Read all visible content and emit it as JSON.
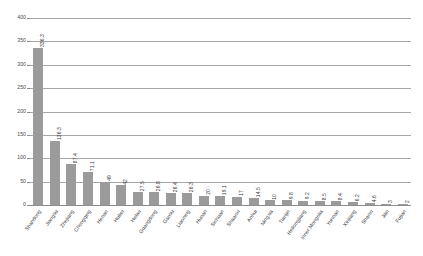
{
  "chart_data": {
    "type": "bar",
    "title": "",
    "xlabel": "",
    "ylabel": "",
    "ylim": [
      0,
      400
    ],
    "yticks": [
      0,
      50,
      100,
      150,
      200,
      250,
      300,
      350,
      400
    ],
    "grid": true,
    "legend": false,
    "bar_color": "#9b9b9b",
    "gridline_color": "#a8a8a8",
    "categories": [
      "Shandong",
      "Jiangsu",
      "Zhejiang",
      "Chongqing",
      "Henan",
      "Hubei",
      "Hebei",
      "Guangdong",
      "Gansu",
      "Liaoning",
      "Hunan",
      "Sichuan",
      "Shaanxi",
      "Anhui",
      "Ningxia",
      "Tianjin",
      "Heilongjiang",
      "Inner Mongolia",
      "Yunnan",
      "Xinjiang",
      "Shanxi",
      "Jilin",
      "Fujian"
    ],
    "values": [
      336.3,
      136.3,
      87.4,
      71.1,
      49,
      42,
      27.5,
      26.8,
      26.4,
      26.3,
      20,
      19.1,
      17,
      14.5,
      10,
      9.8,
      9.2,
      8.5,
      8.4,
      6.2,
      4.6,
      3,
      2
    ],
    "value_labels": [
      "336.3",
      "136.3",
      "87.4",
      "71.1",
      "49",
      "42",
      "27.5",
      "26.8",
      "26.4",
      "26.3",
      "20",
      "19.1",
      "17",
      "14.5",
      "10",
      "9.8",
      "9.2",
      "8.5",
      "8.4",
      "6.2",
      "4.6",
      "3",
      "2"
    ],
    "ytick_labels": [
      "0",
      "50",
      "100",
      "150",
      "200",
      "250",
      "300",
      "350",
      "400"
    ]
  }
}
